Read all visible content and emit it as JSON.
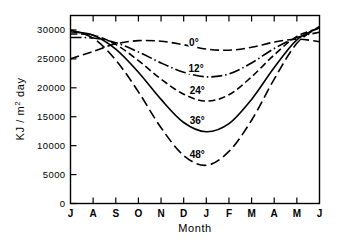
{
  "chart_data": {
    "type": "line",
    "title": "",
    "xlabel": "Month",
    "ylabel": "KJ / m2 day",
    "ylabel_parts": {
      "pre": "KJ / m",
      "sup": "2",
      "post": " day"
    },
    "grid": false,
    "legend_position": "inline-curve-labels",
    "x": [
      "J",
      "A",
      "S",
      "O",
      "N",
      "D",
      "J",
      "F",
      "M",
      "A",
      "M",
      "J"
    ],
    "x_full": [
      "July",
      "August",
      "September",
      "October",
      "November",
      "December",
      "January",
      "February",
      "March",
      "April",
      "May",
      "June"
    ],
    "xtick_labels": [
      "J",
      "A",
      "S",
      "O",
      "N",
      "D",
      "J",
      "F",
      "M",
      "A",
      "M",
      "J"
    ],
    "ytick_labels": [
      "0",
      "5000",
      "10000",
      "15000",
      "20000",
      "25000",
      "30000"
    ],
    "ytick_values": [
      0,
      5000,
      10000,
      15000,
      20000,
      25000,
      30000
    ],
    "ylim": [
      0,
      32500
    ],
    "xlim": [
      0,
      11
    ],
    "series": [
      {
        "name": "0°",
        "label": "0°",
        "linestyle": "longdash",
        "dasharray": "9 4",
        "label_x": 5.45,
        "label_y": 27300,
        "values": [
          25000,
          26300,
          27600,
          28150,
          28050,
          27450,
          26700,
          26500,
          27000,
          27900,
          28400,
          28000
        ]
      },
      {
        "name": "12°",
        "label": "12°",
        "linestyle": "dashdot",
        "dasharray": "11 3 1.5 3",
        "label_x": 5.55,
        "label_y": 22650,
        "values": [
          28700,
          28600,
          27800,
          26200,
          24300,
          22700,
          21900,
          22400,
          24300,
          26800,
          28700,
          29600
        ]
      },
      {
        "name": "24°",
        "label": "24°",
        "linestyle": "dash",
        "dasharray": "7 3.5",
        "label_x": 5.6,
        "label_y": 18950,
        "values": [
          29300,
          29100,
          27500,
          24700,
          21500,
          18900,
          17700,
          18800,
          21900,
          25700,
          28900,
          30300
        ]
      },
      {
        "name": "36°",
        "label": "36°",
        "linestyle": "solid",
        "dasharray": "",
        "label_x": 5.6,
        "label_y": 13750,
        "values": [
          29700,
          29100,
          26700,
          22700,
          18000,
          14000,
          12400,
          13800,
          18000,
          23500,
          28300,
          30400
        ]
      },
      {
        "name": "48°",
        "label": "48°",
        "linestyle": "longdash",
        "dasharray": "10 4.5",
        "label_x": 5.6,
        "label_y": 7800,
        "values": [
          30000,
          28600,
          24800,
          19300,
          13100,
          8300,
          6600,
          9000,
          14400,
          21500,
          27700,
          30600
        ]
      }
    ]
  },
  "axes": {
    "x_axis_title": "Month",
    "y_axis_title": "KJ / m2 day"
  }
}
